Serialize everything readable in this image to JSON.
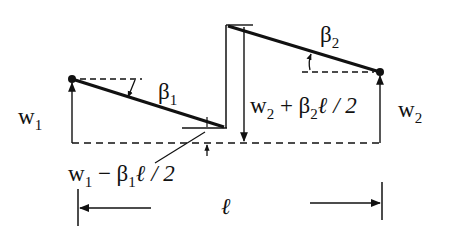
{
  "diagram": {
    "type": "beam element rigid-body rotation / shear offset sketch",
    "colors": {
      "line": "#111111",
      "background": "#ffffff"
    },
    "labels": {
      "w1": {
        "main": "w",
        "sub": "1"
      },
      "w2": {
        "main": "w",
        "sub": "2"
      },
      "beta1": {
        "main": "β",
        "sub": "1"
      },
      "beta2": {
        "main": "β",
        "sub": "2"
      },
      "w2_plus": {
        "w": "w",
        "wsub": "2",
        "op": " + ",
        "b": "β",
        "bsub": "2",
        "rest": "ℓ / 2"
      },
      "w1_minus": {
        "w": "w",
        "wsub": "1",
        "op": " − ",
        "b": "β",
        "bsub": "1",
        "rest": "ℓ / 2"
      },
      "length": "ℓ"
    },
    "nodes": [
      {
        "name": "node-1",
        "x": 72,
        "y": 79
      },
      {
        "name": "node-2",
        "x": 380,
        "y": 72
      }
    ]
  }
}
